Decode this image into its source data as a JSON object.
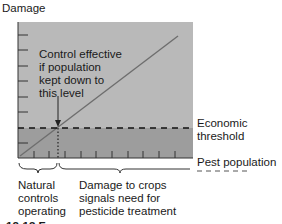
{
  "diagram": {
    "y_axis_label": "Damage",
    "x_axis_label": "Pest population",
    "threshold_label_line1": "Economic",
    "threshold_label_line2": "threshold",
    "annotation": {
      "line1": "Control effective",
      "line2": "if population",
      "line3": "kept down to",
      "line4": "this level"
    },
    "region_left": {
      "line1": "Natural",
      "line2": "controls",
      "line3": "operating"
    },
    "region_right": {
      "line1": "Damage to crops",
      "line2": "signals need for",
      "line3": "pesticide treatment"
    },
    "caption_partial": "12-13 F"
  },
  "colors": {
    "upper_region": "#b8b8b8",
    "lower_region": "#9c9c9c",
    "line": "#6e6e6e",
    "text": "#1a1a1a"
  }
}
